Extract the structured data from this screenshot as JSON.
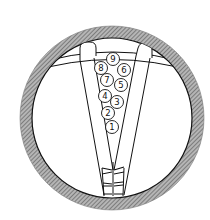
{
  "diagram": {
    "type": "ball-trough-in-circular-frame",
    "colors": {
      "ink": "#111111",
      "ring_hatch": "#8a8a8a",
      "background": "#ffffff"
    },
    "balls": [
      {
        "label": "1",
        "cx": 112,
        "cy": 127
      },
      {
        "label": "2",
        "cx": 108,
        "cy": 113
      },
      {
        "label": "3",
        "cx": 117,
        "cy": 102
      },
      {
        "label": "4",
        "cx": 105,
        "cy": 96
      },
      {
        "label": "5",
        "cx": 121,
        "cy": 85
      },
      {
        "label": "6",
        "cx": 124,
        "cy": 70
      },
      {
        "label": "7",
        "cx": 107,
        "cy": 80
      },
      {
        "label": "8",
        "cx": 101,
        "cy": 68
      },
      {
        "label": "9",
        "cx": 113,
        "cy": 59
      }
    ]
  }
}
